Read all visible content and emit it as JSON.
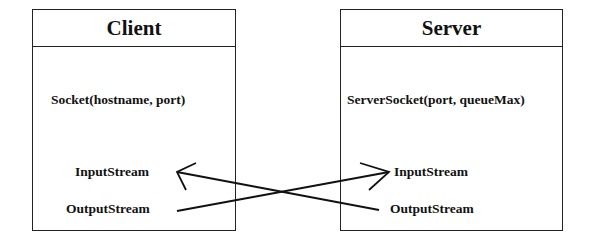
{
  "client": {
    "title": "Client",
    "constructor": "Socket(hostname, port)",
    "input": "InputStream",
    "output": "OutputStream"
  },
  "server": {
    "title": "Server",
    "constructor": "ServerSocket(port, queueMax)",
    "input": "InputStream",
    "output": "OutputStream"
  },
  "connections": [
    {
      "from": "client.output",
      "to": "server.input"
    },
    {
      "from": "server.output",
      "to": "client.input"
    }
  ]
}
